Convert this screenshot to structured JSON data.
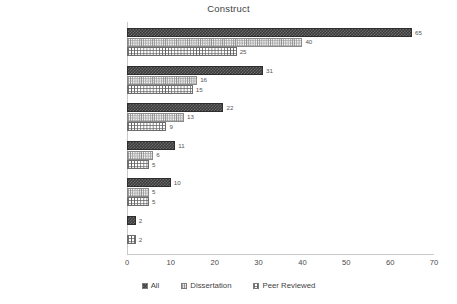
{
  "chart_data": {
    "type": "bar",
    "orientation": "horizontal",
    "title": "Construct",
    "xlabel": "",
    "ylabel": "",
    "xlim": [
      0,
      70
    ],
    "xticks": [
      0,
      10,
      20,
      30,
      40,
      50,
      60,
      70
    ],
    "grid": false,
    "legend_position": "bottom",
    "categories": [
      "Content Knowledge",
      "General Teaching Strategies",
      "Affective Variables",
      "Cognitive Processes",
      "Spatial Reasoning",
      "Perspective"
    ],
    "series": [
      {
        "name": "All",
        "pattern": "dark-checker",
        "values": [
          65,
          31,
          22,
          11,
          10,
          2
        ],
        "labels": [
          "65",
          "31",
          "22",
          "11",
          "10",
          "2"
        ]
      },
      {
        "name": "Dissertation",
        "pattern": "light-crosshatch",
        "values": [
          40,
          16,
          13,
          6,
          5,
          0
        ],
        "labels": [
          "40",
          "16",
          "13",
          "6",
          "5",
          ""
        ]
      },
      {
        "name": "Peer Reviewed",
        "pattern": "grid",
        "values": [
          25,
          15,
          9,
          5,
          5,
          2
        ],
        "labels": [
          "25",
          "15",
          "9",
          "5",
          "5",
          "2"
        ]
      }
    ]
  },
  "legend": {
    "items": [
      {
        "label": "All"
      },
      {
        "label": "Dissertation"
      },
      {
        "label": "Peer Reviewed"
      }
    ]
  },
  "colors": {
    "series_all": "#3c3c3c",
    "series_dissertation": "#ffffff",
    "series_peer_reviewed": "#ffffff",
    "axis": "#c9c9c9",
    "text": "#3f3f3f",
    "background": "#ffffff"
  }
}
